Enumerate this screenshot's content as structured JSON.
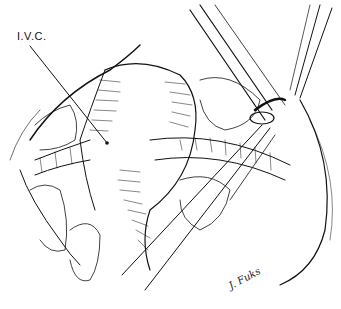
{
  "figure": {
    "type": "surgical anatomical line illustration",
    "labels": [
      {
        "id": "ivc",
        "text": "I.V.C.",
        "x": 17,
        "y": 30,
        "leader_to": [
          107,
          143
        ]
      }
    ],
    "signature": "J. Fuks",
    "colors": {
      "ink": "#111111",
      "background": "#ffffff"
    }
  }
}
